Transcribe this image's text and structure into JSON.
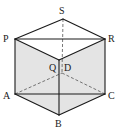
{
  "figure": {
    "type": "cube-projection",
    "vertices": {
      "S": {
        "x": 63,
        "y": 19,
        "label": "S"
      },
      "P": {
        "x": 15,
        "y": 39,
        "label": "P"
      },
      "R": {
        "x": 105,
        "y": 39,
        "label": "R"
      },
      "Q": {
        "x": 59,
        "y": 60,
        "label": "Q"
      },
      "D": {
        "x": 62,
        "y": 73,
        "label": "D"
      },
      "A": {
        "x": 15,
        "y": 94,
        "label": "A"
      },
      "C": {
        "x": 105,
        "y": 94,
        "label": "C"
      },
      "B": {
        "x": 59,
        "y": 115,
        "label": "B"
      }
    },
    "solid_edges": [
      [
        "S",
        "P"
      ],
      [
        "S",
        "R"
      ],
      [
        "P",
        "Q"
      ],
      [
        "Q",
        "R"
      ],
      [
        "P",
        "R"
      ],
      [
        "P",
        "A"
      ],
      [
        "R",
        "C"
      ],
      [
        "Q",
        "B"
      ],
      [
        "A",
        "B"
      ],
      [
        "B",
        "C"
      ],
      [
        "A",
        "C"
      ]
    ],
    "hidden_edges": [
      [
        "S",
        "D"
      ],
      [
        "A",
        "D"
      ],
      [
        "D",
        "C"
      ]
    ],
    "shaded_faces": [
      [
        "P",
        "Q",
        "B",
        "A"
      ],
      [
        "Q",
        "R",
        "C",
        "B"
      ]
    ],
    "colors": {
      "line": "#1a1a1a",
      "hidden": "#555555",
      "shade": "#e4e4e4"
    }
  }
}
